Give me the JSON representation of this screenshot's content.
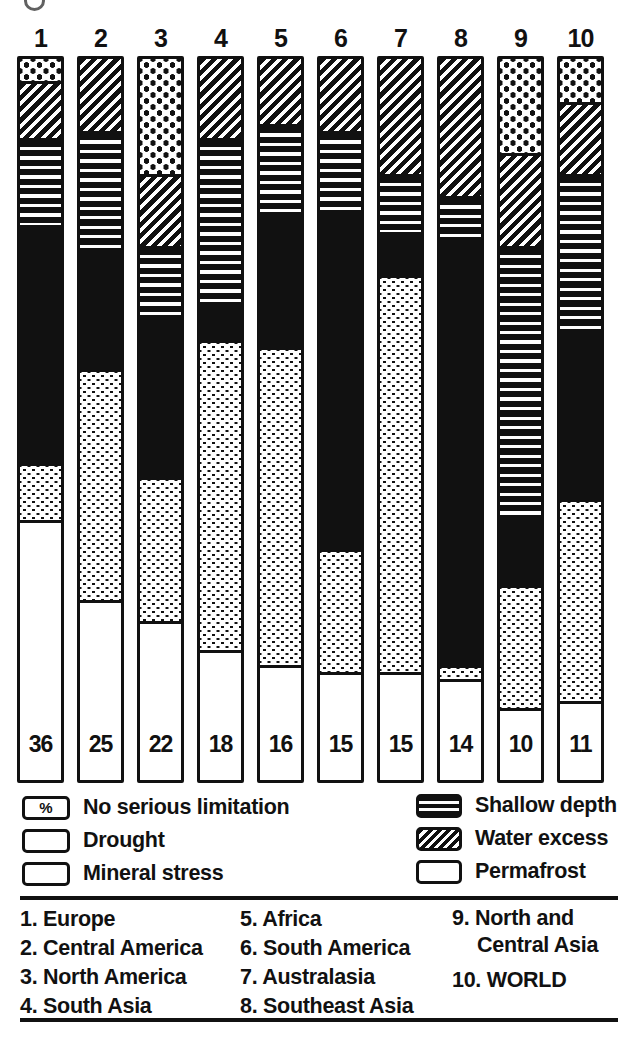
{
  "page": {
    "background": "#ffffff",
    "ink": "#111111"
  },
  "chart_data": {
    "type": "bar",
    "stacked": true,
    "orientation": "vertical",
    "unit": "%",
    "ylim": [
      0,
      100
    ],
    "grid": false,
    "legend_position": "below",
    "categories": [
      "1",
      "2",
      "3",
      "4",
      "5",
      "6",
      "7",
      "8",
      "9",
      "10"
    ],
    "category_names": [
      "Europe",
      "Central America",
      "North America",
      "South Asia",
      "Africa",
      "South America",
      "Australasia",
      "Southeast Asia",
      "North and Central Asia",
      "WORLD"
    ],
    "stack_order_top_to_bottom": [
      "Permafrost",
      "Water excess",
      "Shallow depth",
      "Mineral stress",
      "Drought",
      "No serious limitation"
    ],
    "series": [
      {
        "name": "No serious limitation",
        "pattern": "white",
        "values": [
          36,
          25,
          22,
          18,
          16,
          15,
          15,
          14,
          10,
          11
        ]
      },
      {
        "name": "Drought",
        "pattern": "fine-dots",
        "values": [
          8,
          32,
          20,
          43,
          44,
          17,
          55,
          2,
          17,
          28
        ]
      },
      {
        "name": "Mineral stress",
        "pattern": "solid-black",
        "values": [
          33,
          16,
          22,
          5,
          18,
          47,
          6,
          59,
          9,
          23
        ]
      },
      {
        "name": "Shallow depth",
        "pattern": "horizontal-stripes",
        "values": [
          12,
          17,
          10,
          23,
          13,
          11,
          8,
          6,
          38,
          22
        ]
      },
      {
        "name": "Water excess",
        "pattern": "diagonal-stripes",
        "values": [
          8,
          10,
          10,
          11,
          9,
          10,
          16,
          19,
          13,
          10
        ]
      },
      {
        "name": "Permafrost",
        "pattern": "coarse-dots",
        "values": [
          3,
          0,
          16,
          0,
          0,
          0,
          0,
          0,
          13,
          6
        ]
      }
    ],
    "value_labels": "percentage of No serious limitation shown at base of each bar"
  },
  "legend": {
    "percent_symbol": "%",
    "left": [
      {
        "label": "No serious limitation",
        "swatch": "percent-box"
      },
      {
        "label": "Drought",
        "swatch": "fine-dots"
      },
      {
        "label": "Mineral stress",
        "swatch": "solid-black"
      }
    ],
    "right": [
      {
        "label": "Shallow depth",
        "swatch": "horizontal-stripes"
      },
      {
        "label": "Water excess",
        "swatch": "diagonal-stripes"
      },
      {
        "label": "Permafrost",
        "swatch": "coarse-dots"
      }
    ]
  },
  "region_list": {
    "col1": [
      "1. Europe",
      "2. Central America",
      "3. North America",
      "4. South Asia"
    ],
    "col2": [
      "5. Africa",
      "6. South America",
      "7. Australasia",
      "8. Southeast Asia"
    ],
    "col3": [
      {
        "line1": "9. North and",
        "line2": "Central Asia"
      },
      {
        "line1": "10. WORLD"
      }
    ]
  }
}
